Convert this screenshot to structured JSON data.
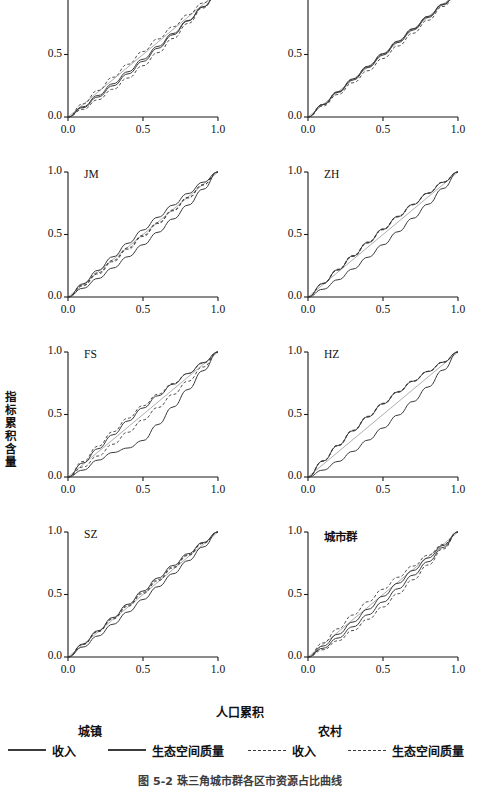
{
  "figure": {
    "xlabel": "人口累积",
    "ylabel": "指标累积含量",
    "caption": "图 5-2  珠三角城市群各区市资源占比曲线"
  },
  "axis": {
    "x_ticks": [
      "0.0",
      "0.5",
      "1.0"
    ],
    "y_ticks": [
      "0.0",
      "0.5",
      "1.0"
    ],
    "xlim": [
      0.0,
      1.0
    ],
    "ylim": [
      0.0,
      1.0
    ]
  },
  "legend": {
    "groups": [
      {
        "title": "城镇",
        "x": 78
      },
      {
        "title": "农村",
        "x": 318
      }
    ],
    "entries": [
      {
        "label": "收入",
        "style": "solid",
        "x": 8
      },
      {
        "label": "生态空间质量",
        "style": "solid",
        "x": 108
      },
      {
        "label": "收入",
        "style": "dashed",
        "x": 248
      },
      {
        "label": "生态空间质量",
        "style": "dashed",
        "x": 348
      }
    ]
  },
  "chart_data": {
    "type": "line",
    "title": "",
    "xlabel": "人口累积",
    "ylabel": "指标累积含量",
    "xlim": [
      0.0,
      1.0
    ],
    "ylim": [
      0.0,
      1.0
    ],
    "grid": false,
    "legend_position": "bottom",
    "x": [
      0.0,
      0.1,
      0.2,
      0.3,
      0.4,
      0.5,
      0.6,
      0.7,
      0.8,
      0.9,
      1.0
    ],
    "reference_line": {
      "name": "equality-line",
      "x": [
        0.0,
        1.0
      ],
      "y": [
        0.0,
        1.0
      ]
    },
    "panels": [
      {
        "name": "GZ",
        "series": [
          {
            "name": "城镇收入",
            "style": "solid",
            "values": [
              0.0,
              0.082,
              0.172,
              0.266,
              0.362,
              0.462,
              0.565,
              0.668,
              0.772,
              0.882,
              1.0
            ]
          },
          {
            "name": "城镇生态空间质量",
            "style": "solid",
            "values": [
              0.0,
              0.075,
              0.16,
              0.25,
              0.345,
              0.445,
              0.55,
              0.658,
              0.768,
              0.88,
              1.0
            ]
          },
          {
            "name": "农村收入",
            "style": "dashed",
            "values": [
              0.0,
              0.062,
              0.138,
              0.222,
              0.312,
              0.41,
              0.515,
              0.628,
              0.748,
              0.872,
              1.0
            ]
          },
          {
            "name": "农村生态空间质量",
            "style": "dashed",
            "values": [
              0.0,
              0.105,
              0.212,
              0.318,
              0.422,
              0.524,
              0.624,
              0.722,
              0.818,
              0.912,
              1.0
            ]
          }
        ]
      },
      {
        "name": "ZQ",
        "series": [
          {
            "name": "城镇收入",
            "style": "solid",
            "values": [
              0.0,
              0.098,
              0.197,
              0.296,
              0.396,
              0.496,
              0.596,
              0.696,
              0.796,
              0.898,
              1.0
            ]
          },
          {
            "name": "城镇生态空间质量",
            "style": "solid",
            "values": [
              0.0,
              0.101,
              0.203,
              0.305,
              0.406,
              0.507,
              0.607,
              0.706,
              0.805,
              0.903,
              1.0
            ]
          },
          {
            "name": "农村收入",
            "style": "dashed",
            "values": [
              0.0,
              0.088,
              0.18,
              0.274,
              0.37,
              0.468,
              0.568,
              0.67,
              0.774,
              0.884,
              1.0
            ]
          },
          {
            "name": "农村生态空间质量",
            "style": "dashed",
            "values": [
              0.0,
              0.1,
              0.201,
              0.302,
              0.403,
              0.504,
              0.604,
              0.704,
              0.803,
              0.902,
              1.0
            ]
          }
        ]
      },
      {
        "name": "JM",
        "series": [
          {
            "name": "城镇收入",
            "style": "solid",
            "values": [
              0.0,
              0.105,
              0.213,
              0.322,
              0.43,
              0.536,
              0.638,
              0.735,
              0.828,
              0.918,
              1.0
            ]
          },
          {
            "name": "城镇生态空间质量",
            "style": "solid",
            "values": [
              0.0,
              0.07,
              0.148,
              0.232,
              0.322,
              0.418,
              0.518,
              0.624,
              0.735,
              0.862,
              1.0
            ]
          },
          {
            "name": "农村收入",
            "style": "dashed",
            "values": [
              0.0,
              0.09,
              0.185,
              0.283,
              0.383,
              0.485,
              0.588,
              0.69,
              0.792,
              0.896,
              1.0
            ]
          },
          {
            "name": "农村生态空间质量",
            "style": "dashed",
            "values": [
              0.0,
              0.096,
              0.194,
              0.293,
              0.393,
              0.494,
              0.595,
              0.696,
              0.797,
              0.898,
              1.0
            ]
          }
        ]
      },
      {
        "name": "ZH",
        "series": [
          {
            "name": "城镇收入",
            "style": "solid",
            "values": [
              0.0,
              0.108,
              0.218,
              0.328,
              0.436,
              0.542,
              0.644,
              0.74,
              0.83,
              0.918,
              1.0
            ]
          },
          {
            "name": "城镇生态空间质量",
            "style": "solid",
            "values": [
              0.0,
              0.062,
              0.138,
              0.224,
              0.318,
              0.418,
              0.522,
              0.63,
              0.742,
              0.868,
              1.0
            ]
          },
          {
            "name": "农村收入",
            "style": "dashed",
            "values": [
              0.0,
              0.106,
              0.215,
              0.324,
              0.432,
              0.538,
              0.641,
              0.738,
              0.83,
              0.918,
              1.0
            ]
          },
          {
            "name": "农村生态空间质量",
            "style": "dashed",
            "values": [
              0.0,
              0.11,
              0.222,
              0.332,
              0.44,
              0.545,
              0.646,
              0.742,
              0.832,
              0.919,
              1.0
            ]
          }
        ]
      },
      {
        "name": "FS",
        "series": [
          {
            "name": "城镇收入",
            "style": "solid",
            "values": [
              0.0,
              0.112,
              0.226,
              0.338,
              0.448,
              0.552,
              0.65,
              0.742,
              0.828,
              0.915,
              1.0
            ]
          },
          {
            "name": "城镇生态空间质量",
            "style": "solid",
            "values": [
              0.0,
              0.055,
              0.135,
              0.196,
              0.232,
              0.292,
              0.42,
              0.56,
              0.7,
              0.85,
              1.0
            ]
          },
          {
            "name": "农村收入",
            "style": "dashed",
            "values": [
              0.0,
              0.08,
              0.168,
              0.262,
              0.358,
              0.456,
              0.556,
              0.66,
              0.766,
              0.88,
              1.0
            ]
          },
          {
            "name": "农村生态空间质量",
            "style": "dashed",
            "values": [
              0.0,
              0.124,
              0.246,
              0.362,
              0.47,
              0.57,
              0.662,
              0.748,
              0.828,
              0.91,
              1.0
            ]
          }
        ]
      },
      {
        "name": "HZ",
        "series": [
          {
            "name": "城镇收入",
            "style": "solid",
            "values": [
              0.0,
              0.128,
              0.252,
              0.37,
              0.482,
              0.586,
              0.68,
              0.766,
              0.844,
              0.918,
              1.0
            ]
          },
          {
            "name": "城镇生态空间质量",
            "style": "solid",
            "values": [
              0.0,
              0.055,
              0.124,
              0.205,
              0.295,
              0.392,
              0.495,
              0.604,
              0.72,
              0.855,
              1.0
            ]
          },
          {
            "name": "农村收入",
            "style": "dashed",
            "values": [
              0.0,
              0.126,
              0.25,
              0.368,
              0.48,
              0.584,
              0.678,
              0.765,
              0.844,
              0.918,
              1.0
            ]
          },
          {
            "name": "农村生态空间质量",
            "style": "dashed",
            "values": [
              0.0,
              0.13,
              0.255,
              0.374,
              0.486,
              0.59,
              0.684,
              0.769,
              0.846,
              0.92,
              1.0
            ]
          }
        ]
      },
      {
        "name": "SZ",
        "series": [
          {
            "name": "城镇收入",
            "style": "solid",
            "values": [
              0.0,
              0.104,
              0.21,
              0.316,
              0.422,
              0.528,
              0.632,
              0.732,
              0.826,
              0.916,
              1.0
            ]
          },
          {
            "name": "城镇生态空间质量",
            "style": "solid",
            "values": [
              0.0,
              0.08,
              0.168,
              0.262,
              0.36,
              0.46,
              0.562,
              0.666,
              0.77,
              0.88,
              1.0
            ]
          },
          {
            "name": "农村收入",
            "style": "dashed",
            "values": [
              0.0,
              0.1,
              0.202,
              0.304,
              0.406,
              0.508,
              0.61,
              0.712,
              0.812,
              0.908,
              1.0
            ]
          },
          {
            "name": "农村生态空间质量",
            "style": "dashed",
            "values": [
              0.0,
              0.102,
              0.206,
              0.31,
              0.414,
              0.518,
              0.62,
              0.72,
              0.818,
              0.912,
              1.0
            ]
          }
        ]
      },
      {
        "name": "城市群",
        "series": [
          {
            "name": "城镇收入",
            "style": "solid",
            "values": [
              0.0,
              0.088,
              0.182,
              0.28,
              0.382,
              0.486,
              0.59,
              0.692,
              0.792,
              0.892,
              1.0
            ]
          },
          {
            "name": "城镇生态空间质量",
            "style": "solid",
            "values": [
              0.0,
              0.07,
              0.152,
              0.242,
              0.338,
              0.44,
              0.546,
              0.654,
              0.762,
              0.876,
              1.0
            ]
          },
          {
            "name": "农村收入",
            "style": "dashed",
            "values": [
              0.0,
              0.058,
              0.13,
              0.212,
              0.302,
              0.4,
              0.506,
              0.618,
              0.736,
              0.864,
              1.0
            ]
          },
          {
            "name": "农村生态空间质量",
            "style": "dashed",
            "values": [
              0.0,
              0.112,
              0.226,
              0.336,
              0.442,
              0.542,
              0.638,
              0.728,
              0.814,
              0.9,
              1.0
            ]
          }
        ]
      }
    ]
  }
}
